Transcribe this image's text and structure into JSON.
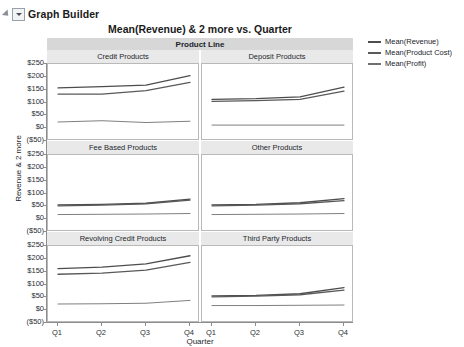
{
  "window": {
    "title": "Graph Builder",
    "disclosure_icon": "triangle-collapse-icon",
    "menu_icon": "chevron-down-icon"
  },
  "chart_data": {
    "type": "line",
    "title": "Mean(Revenue) & 2 more vs. Quarter",
    "xlabel": "Quarter",
    "ylabel": "Revenue & 2 more",
    "x": [
      "Q1",
      "Q2",
      "Q3",
      "Q4"
    ],
    "ylim": [
      -50,
      250
    ],
    "ytick_labels": [
      "$250",
      "$200",
      "$150",
      "$100",
      "$50",
      "$0",
      "($50)"
    ],
    "ytick_values": [
      250,
      200,
      150,
      100,
      50,
      0,
      -50
    ],
    "grid": false,
    "legend_position": "right",
    "facet_label": "Product Line",
    "facet_rows": 3,
    "facet_cols": 2,
    "series_colors": {
      "Mean(Revenue)": "#4d4d4d",
      "Mean(Product Cost)": "#595959",
      "Mean(Profit)": "#707070"
    },
    "legend": [
      {
        "name": "Mean(Revenue)",
        "color": "#4d4d4d"
      },
      {
        "name": "Mean(Product Cost)",
        "color": "#595959"
      },
      {
        "name": "Mean(Profit)",
        "color": "#707070"
      }
    ],
    "panels": [
      {
        "name": "Credit Products",
        "series": [
          {
            "name": "Mean(Revenue)",
            "values": [
              157,
              162,
              168,
              205
            ]
          },
          {
            "name": "Mean(Product Cost)",
            "values": [
              133,
              133,
              146,
              178
            ]
          },
          {
            "name": "Mean(Profit)",
            "values": [
              24,
              29,
              22,
              27
            ]
          }
        ]
      },
      {
        "name": "Deposit Products",
        "series": [
          {
            "name": "Mean(Revenue)",
            "values": [
              112,
              115,
              122,
              160
            ]
          },
          {
            "name": "Mean(Product Cost)",
            "values": [
              104,
              107,
              112,
              144
            ]
          },
          {
            "name": "Mean(Profit)",
            "values": [
              12,
              12,
              12,
              12
            ]
          }
        ]
      },
      {
        "name": "Fee Based Products",
        "series": [
          {
            "name": "Mean(Revenue)",
            "values": [
              56,
              58,
              62,
              78
            ]
          },
          {
            "name": "Mean(Product Cost)",
            "values": [
              52,
              55,
              60,
              74
            ]
          },
          {
            "name": "Mean(Profit)",
            "values": [
              18,
              19,
              20,
              22
            ]
          }
        ]
      },
      {
        "name": "Other Products",
        "series": [
          {
            "name": "Mean(Revenue)",
            "values": [
              56,
              58,
              64,
              80
            ]
          },
          {
            "name": "Mean(Product Cost)",
            "values": [
              52,
              55,
              60,
              72
            ]
          },
          {
            "name": "Mean(Profit)",
            "values": [
              18,
              19,
              20,
              22
            ]
          }
        ]
      },
      {
        "name": "Revolving Credit Products",
        "series": [
          {
            "name": "Mean(Revenue)",
            "values": [
              162,
              168,
              180,
              212
            ]
          },
          {
            "name": "Mean(Product Cost)",
            "values": [
              140,
              144,
              156,
              186
            ]
          },
          {
            "name": "Mean(Profit)",
            "values": [
              24,
              25,
              27,
              38
            ]
          }
        ]
      },
      {
        "name": "Third Party Products",
        "series": [
          {
            "name": "Mean(Revenue)",
            "values": [
              56,
              58,
              64,
              88
            ]
          },
          {
            "name": "Mean(Product Cost)",
            "values": [
              52,
              55,
              60,
              78
            ]
          },
          {
            "name": "Mean(Profit)",
            "values": [
              18,
              18,
              19,
              20
            ]
          }
        ]
      }
    ]
  }
}
